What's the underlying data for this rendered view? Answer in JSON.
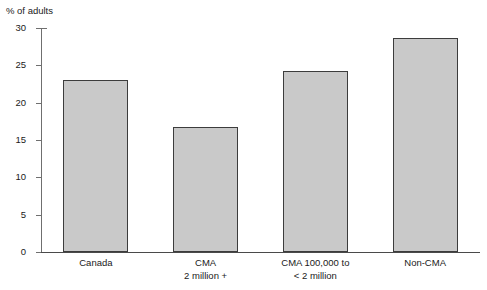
{
  "chart_data": {
    "type": "bar",
    "title": "",
    "subtitle": "",
    "ylabel": "% of adults",
    "xlabel": "",
    "categories": [
      "Canada",
      "CMA 2 million +",
      "CMA 100,000 to < 2 million",
      "Non-CMA"
    ],
    "category_lines": [
      [
        "Canada",
        ""
      ],
      [
        "CMA",
        "2 million +"
      ],
      [
        "CMA 100,000 to",
        "< 2 million"
      ],
      [
        "Non-CMA",
        ""
      ]
    ],
    "values": [
      23.0,
      16.8,
      24.3,
      28.7
    ],
    "ylim": [
      0,
      30
    ],
    "ytick_values": [
      0,
      5,
      10,
      15,
      20,
      25,
      30
    ],
    "ytick_labels": [
      "0",
      "5",
      "10",
      "15",
      "20",
      "25",
      "30"
    ],
    "grid": false,
    "legend": null,
    "bar_fill_color": "#c9c9c9",
    "bar_border_color": "#3c3c3c",
    "axis_color": "#4a4a4a"
  }
}
